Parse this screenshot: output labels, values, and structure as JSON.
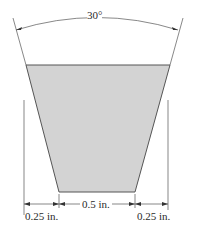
{
  "figure": {
    "shape": "trapezoid-cross-section",
    "fill_color": "#d3d3d3",
    "stroke_color": "#555555",
    "angle_label": "30°",
    "dimensions": {
      "left_offset": "0.25 in.",
      "bottom_width": "0.5 in.",
      "right_offset": "0.25 in."
    }
  }
}
